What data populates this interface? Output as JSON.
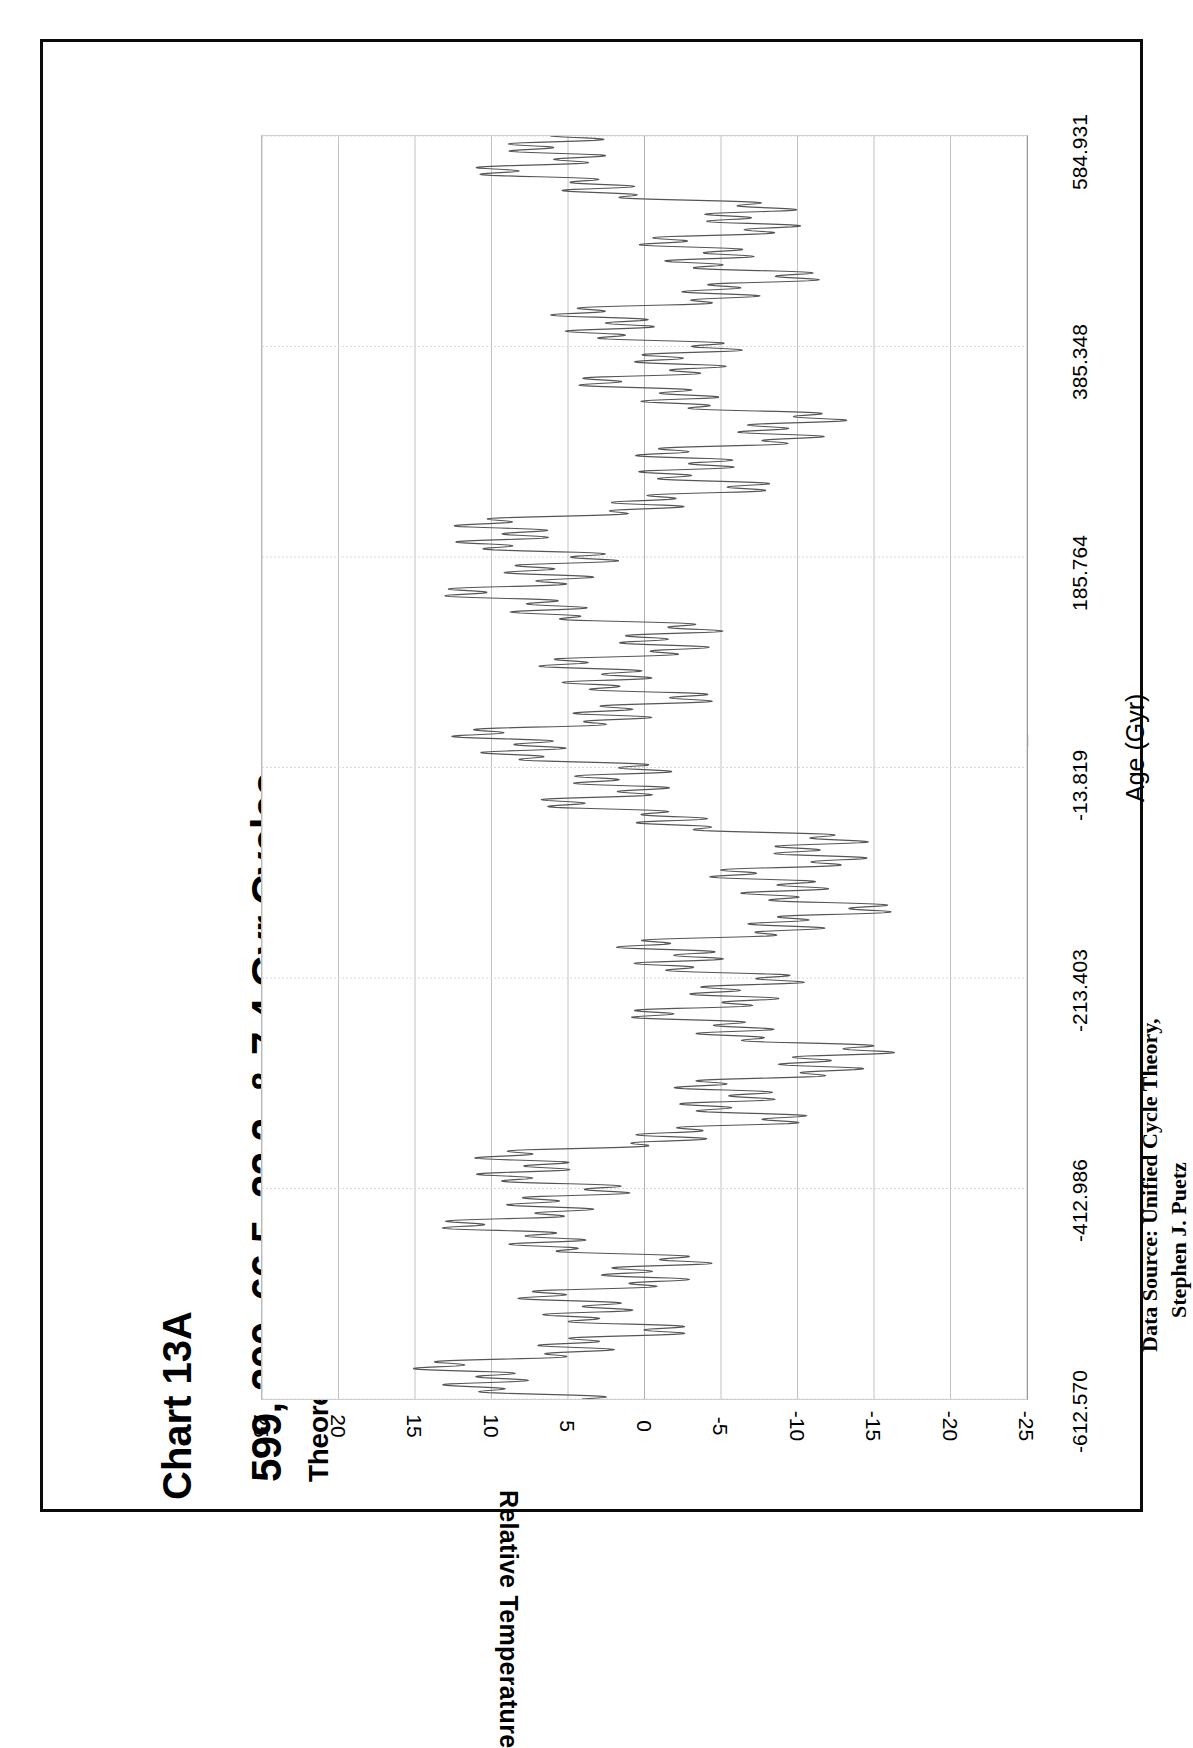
{
  "figure": {
    "chart_number": "Chart 13A",
    "title": "599, 200, 66.5, 22,2, & 7.4 Gyr Cycles",
    "subtitle": "Theoretical Oscillations in Extra-Universal Temperature",
    "data_source_line1": "Data Source:  Unified Cycle Theory,",
    "data_source_line2": "Stephen J. Puetz",
    "annotation_arrow": "left-arrow-marker"
  },
  "chart_data": {
    "type": "line",
    "title": "599, 200, 66.5, 22,2, & 7.4 Gyr Cycles",
    "subtitle": "Theoretical Oscillations in Extra-Universal Temperature",
    "orientation": "rotated-90-clockwise-print",
    "xlabel": "Age (Gyr)",
    "ylabel": "Relative Temperature",
    "xlim": [
      -612.57,
      584.931
    ],
    "ylim": [
      -25,
      25
    ],
    "grid": true,
    "legend": null,
    "x_tick_labels": [
      "-612.570",
      "-412.986",
      "-213.403",
      "-13.819",
      "185.764",
      "385.348",
      "584.931"
    ],
    "x_tick_values": [
      -612.57,
      -412.986,
      -213.403,
      -13.819,
      185.764,
      385.348,
      584.931
    ],
    "y_tick_labels": [
      "25",
      "20",
      "15",
      "10",
      "5",
      "0",
      "-5",
      "-10",
      "-15",
      "-20",
      "-25"
    ],
    "y_tick_values": [
      25,
      20,
      15,
      10,
      5,
      0,
      -5,
      -10,
      -15,
      -20,
      -25
    ],
    "annotations": [
      {
        "text": "",
        "icon": "left-arrow",
        "at_x": -13.819,
        "at_y": -22.5,
        "note": "arrow marking present-day age -13.819 Gyr"
      }
    ],
    "series": [
      {
        "name": "Theoretical extra-universal temperature",
        "color": "#555555",
        "composition": {
          "cycles_gyr": [
            599,
            200,
            66.5,
            22.2,
            7.4
          ],
          "description": "Sum of five superimposed harmonic cycles of periods 599, 200, 66.5, 22.2 and 7.4 Gyr"
        },
        "range_observed": [
          -20.5,
          20.5
        ]
      }
    ]
  }
}
